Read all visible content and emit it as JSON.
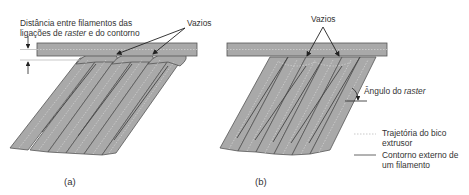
{
  "diagram": {
    "panel_a": {
      "caption": "(a)",
      "distance_label_line1": "Distância entre filamentos das",
      "distance_label_line2_pre": "ligações de ",
      "distance_label_line2_italic": "raster",
      "distance_label_line2_post": " e do contorno",
      "voids_label": "Vazios"
    },
    "panel_b": {
      "caption": "(b)",
      "voids_label": "Vazios",
      "raster_angle_label_pre": "Ângulo do ",
      "raster_angle_label_italic": "raster"
    },
    "legend": {
      "items": [
        {
          "style": "dashed",
          "line1": "Trajetória do bico",
          "line2": "extrusor"
        },
        {
          "style": "solid",
          "line1": "Contorno externo de",
          "line2": "um filamento"
        }
      ]
    },
    "colors": {
      "filament_fill": "#a9a9a9",
      "filament_edge": "#555555",
      "path_dash": "#d0d0d0",
      "arrow": "#222222"
    }
  }
}
